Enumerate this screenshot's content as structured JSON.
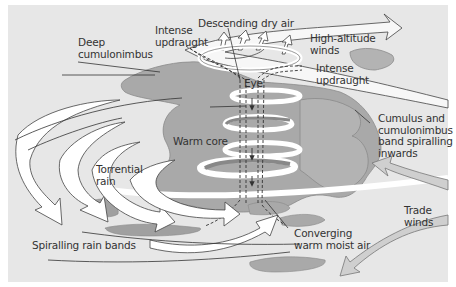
{
  "diagram": {
    "colors": {
      "background": "#e7e7e7",
      "cloud": "#a9a9a9",
      "cloud_dark": "#8f8f8f",
      "arrow_fill": "#ffffff",
      "trade_wind_fill": "#cfcfcf",
      "line": "#333333",
      "text": "#333333"
    },
    "labels": {
      "deep_cumulonimbus": [
        "Deep",
        "cumulonimbus"
      ],
      "intense_updraught_left": [
        "Intense",
        "updraught"
      ],
      "descending_dry_air": "Descending dry air",
      "high_altitude_winds": [
        "High-altitude",
        "winds"
      ],
      "eye": "Eye",
      "intense_updraught_right": [
        "Intense",
        "updraught"
      ],
      "cumulus_band": [
        "Cumulus and",
        "cumulonimbus",
        "band spiralling",
        "inwards"
      ],
      "warm_core": "Warm core",
      "torrential_rain": [
        "Torrential",
        "rain"
      ],
      "trade_winds": [
        "Trade",
        "winds"
      ],
      "spiralling_rain_bands": "Spiralling rain bands",
      "converging_air": [
        "Converging",
        "warm moist air"
      ]
    }
  }
}
